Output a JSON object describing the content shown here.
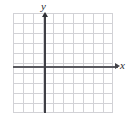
{
  "figure": {
    "name": "cartesian-coordinate-grid",
    "background_color": "#ffffff",
    "axis_color": "#45454b",
    "grid_color": "#d2d2d6"
  },
  "axes": {
    "x_label": "x",
    "y_label": "x-placeholder",
    "y_label_text": "y",
    "x_arrow": "arrow-right",
    "y_arrow": "arrow-up"
  },
  "chart_data": {
    "type": "scatter",
    "title": "",
    "xlabel": "x",
    "ylabel": "y",
    "grid": true,
    "legend": "none",
    "x": [],
    "y": [],
    "series": [],
    "annotations": [],
    "grid_columns": 10,
    "grid_rows": 10,
    "grid_cell_size_px": 10,
    "origin_column_index": 3,
    "origin_row_index": 5,
    "xlim": [
      -3.2,
      6.8
    ],
    "ylim": [
      -4.6,
      5.4
    ],
    "xticks": [],
    "yticks": [],
    "tick_labels_visible": false
  }
}
